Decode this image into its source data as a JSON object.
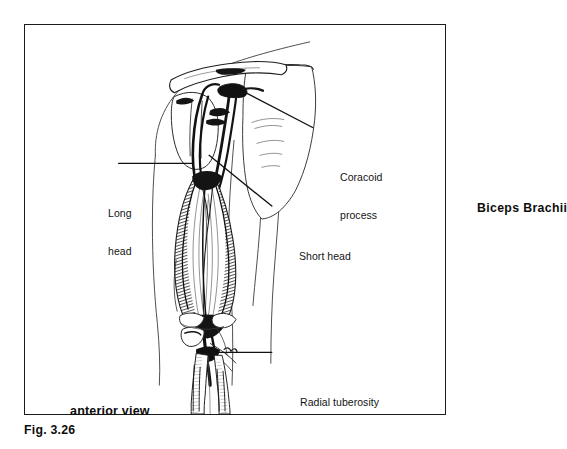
{
  "figure": {
    "number": "Fig. 3.26",
    "title": "Biceps Brachii",
    "view_label": "anterior view",
    "frame_color": "#1b1b1b",
    "ink_color": "#141414",
    "background_color": "#ffffff"
  },
  "illustration": {
    "subject": "biceps-brachii-muscle",
    "description": "anterior-view-line-drawing-of-right-arm-shoulder-and-forearm"
  },
  "callouts": [
    {
      "id": "coracoid-process",
      "line1": "Coracoid",
      "line2": "process",
      "leader": "diagonal-up-left"
    },
    {
      "id": "long-head",
      "line1": "Long",
      "line2": "head",
      "leader": "horizontal-right"
    },
    {
      "id": "short-head",
      "line1": "Short head",
      "line2": "",
      "leader": "diagonal-up-left"
    },
    {
      "id": "radial-tuberosity",
      "line1": "Radial tuberosity",
      "line2": "",
      "leader": "horizontal-left"
    }
  ]
}
